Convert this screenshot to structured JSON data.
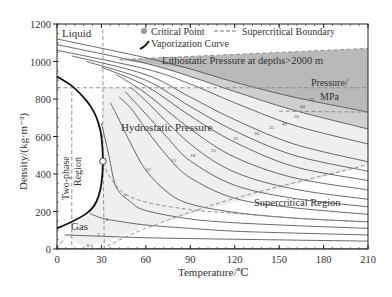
{
  "chart_data": {
    "type": "line",
    "title": "",
    "xlabel": "Temperature/℃",
    "ylabel": "Density/(kg·m⁻³)",
    "xlim": [
      0,
      210
    ],
    "ylim": [
      0,
      1200
    ],
    "x_ticks": [
      0,
      30,
      60,
      90,
      120,
      150,
      180,
      210
    ],
    "y_ticks": [
      0,
      200,
      400,
      600,
      800,
      1000,
      1200
    ],
    "grid": false,
    "legend_position": "top",
    "legend": [
      {
        "label": "Critical Point",
        "marker": "gray-circle"
      },
      {
        "label": "Supercritical Boundary",
        "marker": "dashed-line"
      },
      {
        "label": "Vaporization Curve",
        "marker": "thick-black-curve"
      }
    ],
    "critical_point": {
      "temperature": 31,
      "density": 468
    },
    "supercritical_boundary": {
      "temperature": 31,
      "pressure_MPa": 7.38
    },
    "isobars_MPa": [
      0.1,
      3,
      6,
      9,
      12,
      15,
      18,
      21,
      25,
      30,
      35,
      40,
      50,
      60,
      70
    ],
    "series": [
      {
        "name": "0.1",
        "x": [
          0,
          60,
          120,
          210
        ],
        "y": [
          2,
          2,
          2,
          1
        ]
      },
      {
        "name": "3",
        "x": [
          5,
          30,
          60,
          120,
          210
        ],
        "y": [
          75,
          68,
          60,
          52,
          42
        ]
      },
      {
        "name": "6",
        "x": [
          22,
          25,
          30,
          40,
          60,
          90,
          120,
          160,
          210
        ],
        "y": [
          190,
          180,
          165,
          150,
          128,
          110,
          95,
          85,
          75
        ]
      },
      {
        "name": "9",
        "x": [
          30,
          35,
          40,
          50,
          60,
          90,
          120,
          160,
          210
        ],
        "y": [
          670,
          500,
          330,
          250,
          205,
          160,
          140,
          125,
          110
        ]
      },
      {
        "name": "12",
        "x": [
          36,
          40,
          50,
          60,
          75,
          90,
          120,
          160,
          210
        ],
        "y": [
          780,
          720,
          560,
          420,
          300,
          240,
          195,
          165,
          145
        ]
      },
      {
        "name": "15",
        "x": [
          42,
          50,
          60,
          75,
          90,
          120,
          160,
          210
        ],
        "y": [
          810,
          750,
          640,
          490,
          380,
          270,
          220,
          185
        ]
      },
      {
        "name": "18",
        "x": [
          46,
          60,
          75,
          90,
          120,
          160,
          210
        ],
        "y": [
          840,
          720,
          590,
          470,
          340,
          270,
          225
        ]
      },
      {
        "name": "21",
        "x": [
          50,
          60,
          90,
          120,
          160,
          210
        ],
        "y": [
          860,
          790,
          560,
          410,
          320,
          265
        ]
      },
      {
        "name": "25",
        "x": [
          40,
          60,
          90,
          120,
          160,
          210
        ],
        "y": [
          930,
          830,
          640,
          490,
          380,
          315
        ]
      },
      {
        "name": "30",
        "x": [
          30,
          60,
          90,
          120,
          160,
          210
        ],
        "y": [
          970,
          870,
          710,
          570,
          440,
          365
        ]
      },
      {
        "name": "35",
        "x": [
          20,
          60,
          90,
          120,
          160,
          210
        ],
        "y": [
          1000,
          900,
          760,
          630,
          500,
          415
        ]
      },
      {
        "name": "40",
        "x": [
          10,
          60,
          90,
          120,
          160,
          210
        ],
        "y": [
          1030,
          930,
          810,
          690,
          560,
          465
        ]
      },
      {
        "name": "50",
        "x": [
          0,
          60,
          90,
          120,
          160,
          210
        ],
        "y": [
          1060,
          960,
          880,
          780,
          660,
          560
        ]
      },
      {
        "name": "60",
        "x": [
          0,
          60,
          90,
          120,
          160,
          210
        ],
        "y": [
          1090,
          990,
          920,
          840,
          740,
          640
        ]
      },
      {
        "name": "70",
        "x": [
          0,
          60,
          90,
          120,
          160,
          210
        ],
        "y": [
          1120,
          1020,
          960,
          890,
          810,
          730
        ]
      }
    ],
    "vaporization_curve": {
      "x": [
        0,
        10,
        20,
        25,
        28,
        30,
        31,
        30,
        28,
        25,
        20,
        10,
        0
      ],
      "y": [
        920,
        870,
        790,
        730,
        670,
        600,
        468,
        350,
        280,
        230,
        190,
        145,
        110
      ]
    },
    "annotations": [
      {
        "text": "Liquid",
        "x": 3,
        "y": 1150
      },
      {
        "text": "Lithostatic Pressure at depths>2000 m",
        "x": 72,
        "y": 1015
      },
      {
        "text": "Pressure/",
        "x": 180,
        "y": 880
      },
      {
        "text": "MPa",
        "x": 186,
        "y": 830
      },
      {
        "text": "Hydrostatic Pressure",
        "x": 40,
        "y": 625
      },
      {
        "text": "Two-phase",
        "x": 6,
        "y": 500
      },
      {
        "text": "Region",
        "x": 19,
        "y": 500
      },
      {
        "text": "Supercritical Region",
        "x": 108,
        "y": 250
      },
      {
        "text": "Gas",
        "x": 10,
        "y": 125
      }
    ]
  },
  "labels": {
    "critical_point": "Critical Point",
    "supercritical_boundary": "Supercritical Boundary",
    "vaporization_curve": "Vaporization Curve",
    "xlabel": "Temperature/℃",
    "ylabel": "Density/(kg·m⁻³)",
    "liquid": "Liquid",
    "lithostatic": "Lithostatic Pressure at depths>2000 m",
    "pressure_unit_1": "Pressure/",
    "pressure_unit_2": "MPa",
    "hydrostatic": "Hydrostatic Pressure",
    "two_phase_1": "Two-phase",
    "two_phase_2": "Region",
    "supercritical_region": "Supercritical Region",
    "gas": "Gas"
  },
  "colors": {
    "lithostatic_fill": "#b9b9b9",
    "lithostatic_band": "#cfcfcf",
    "hydrostatic_fill": "#efefef",
    "isobar": "#444444",
    "vaporization": "#111111",
    "boundary": "#888888",
    "axis": "#222222"
  }
}
